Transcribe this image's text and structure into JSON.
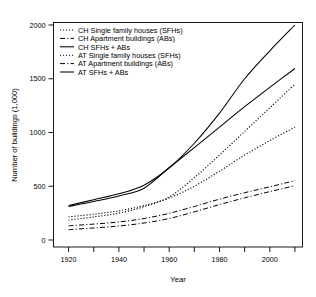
{
  "chart_data": {
    "type": "line",
    "title": "",
    "xlabel": "Year",
    "ylabel": "Number of buildings (1,000)",
    "xlim": [
      1914,
      2013
    ],
    "ylim": [
      0,
      2100
    ],
    "grid": false,
    "legend_position": "top-left",
    "x_ticks": [
      1920,
      1930,
      1940,
      1950,
      1960,
      1970,
      1980,
      1990,
      2000,
      2010
    ],
    "x_tick_labels": [
      "1920",
      "",
      "1940",
      "",
      "1960",
      "",
      "1980",
      "",
      "2000",
      ""
    ],
    "y_ticks": [
      0,
      500,
      1000,
      1500,
      2000
    ],
    "y_tick_labels": [
      "0",
      "500",
      "1000",
      "1500",
      "2000"
    ],
    "x": [
      1920,
      1930,
      1940,
      1950,
      1960,
      1970,
      1980,
      1990,
      2000,
      2010
    ],
    "series": [
      {
        "name": "CH Single family houses (SFHs)",
        "style": "dotted",
        "country": "CH",
        "category": "Single family houses (SFHs)",
        "values": [
          185,
          215,
          250,
          310,
          400,
          580,
          790,
          1010,
          1230,
          1450
        ]
      },
      {
        "name": "CH Apartment buildings (ABs)",
        "style": "dash-dot",
        "country": "CH",
        "category": "Apartment buildings (ABs)",
        "values": [
          132,
          148,
          168,
          200,
          248,
          312,
          380,
          440,
          495,
          552
        ]
      },
      {
        "name": "CH SFHs + ABs",
        "style": "solid",
        "country": "CH",
        "category": "SFHs + ABs",
        "values": [
          320,
          375,
          430,
          510,
          672,
          900,
          1180,
          1500,
          1760,
          2000
        ]
      },
      {
        "name": "AT Single family houses (SFHs)",
        "style": "dotted",
        "country": "AT",
        "category": "Single family houses (SFHs)",
        "values": [
          215,
          240,
          272,
          320,
          390,
          500,
          640,
          790,
          925,
          1050
        ]
      },
      {
        "name": "AT Apartment buildings (ABs)",
        "style": "dash-dot",
        "country": "AT",
        "category": "Apartment buildings (ABs)",
        "values": [
          96,
          112,
          130,
          158,
          200,
          262,
          330,
          392,
          450,
          505
        ]
      },
      {
        "name": "AT SFHs + ABs",
        "style": "solid",
        "country": "AT",
        "category": "SFHs + ABs",
        "values": [
          312,
          358,
          410,
          482,
          672,
          860,
          1050,
          1240,
          1420,
          1595
        ]
      }
    ]
  },
  "legend": {
    "items": [
      {
        "label": "CH Single family houses (SFHs)",
        "style": "dotted"
      },
      {
        "label": "CH Apartment buildings (ABs)",
        "style": "dash-dot"
      },
      {
        "label": "CH SFHs + ABs",
        "style": "solid"
      },
      {
        "label": "AT Single family houses (SFHs)",
        "style": "dotted"
      },
      {
        "label": "AT Apartment buildings (ABs)",
        "style": "dash-dot"
      },
      {
        "label": "AT SFHs + ABs",
        "style": "solid"
      }
    ]
  },
  "colors": {
    "line": "#000000",
    "axis": "#000000",
    "background": "#ffffff"
  }
}
